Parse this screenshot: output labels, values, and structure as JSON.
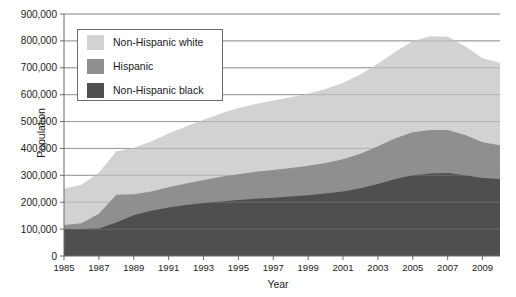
{
  "clipped_header": "",
  "axes": {
    "y_title": "Population",
    "x_title": "Year",
    "y_ticks": [
      "0",
      "100,000",
      "200,000",
      "300,000",
      "400,000",
      "500,000",
      "600,000",
      "700,000",
      "800,000",
      "900,000"
    ],
    "x_ticks": [
      "1985",
      "1987",
      "1989",
      "1991",
      "1993",
      "1995",
      "1997",
      "1999",
      "2001",
      "2003",
      "2005",
      "2007",
      "2009"
    ]
  },
  "legend": {
    "position": "inside-top-left",
    "items": [
      {
        "label": "Non-Hispanic white",
        "color": "#d2d2d2"
      },
      {
        "label": "Hispanic",
        "color": "#8f8f8f"
      },
      {
        "label": "Non-Hispanic black",
        "color": "#4f4f4f"
      }
    ]
  },
  "colors": {
    "non_hispanic_white": "#d2d2d2",
    "hispanic": "#8f8f8f",
    "non_hispanic_black": "#4f4f4f",
    "gridline": "#8c8c8c",
    "axis": "#6b6b6b",
    "background": "#ffffff"
  },
  "chart_data": {
    "type": "area",
    "stacked": true,
    "title": "",
    "xlabel": "Year",
    "ylabel": "Population",
    "xlim": [
      1985,
      2010
    ],
    "ylim": [
      0,
      900000
    ],
    "ytick_interval": 100000,
    "grid": true,
    "legend_position": "inside-top-left",
    "x": [
      1985,
      1986,
      1987,
      1988,
      1989,
      1990,
      1991,
      1992,
      1993,
      1994,
      1995,
      1996,
      1997,
      1998,
      1999,
      2000,
      2001,
      2002,
      2003,
      2004,
      2005,
      2006,
      2007,
      2008,
      2009,
      2010
    ],
    "categories": [
      "1985",
      "1986",
      "1987",
      "1988",
      "1989",
      "1990",
      "1991",
      "1992",
      "1993",
      "1994",
      "1995",
      "1996",
      "1997",
      "1998",
      "1999",
      "2000",
      "2001",
      "2002",
      "2003",
      "2004",
      "2005",
      "2006",
      "2007",
      "2008",
      "2009",
      "2010"
    ],
    "series": [
      {
        "name": "Non-Hispanic black",
        "color": "#4f4f4f",
        "values": [
          100000,
          100000,
          102000,
          125000,
          152000,
          168000,
          180000,
          190000,
          197000,
          203000,
          208000,
          213000,
          217000,
          221000,
          226000,
          232000,
          240000,
          252000,
          268000,
          286000,
          300000,
          307000,
          309000,
          300000,
          290000,
          286000
        ]
      },
      {
        "name": "Hispanic",
        "color": "#8f8f8f",
        "values": [
          15000,
          22000,
          55000,
          103000,
          78000,
          72000,
          76000,
          80000,
          86000,
          92000,
          96000,
          100000,
          103000,
          106000,
          110000,
          114000,
          120000,
          128000,
          140000,
          152000,
          160000,
          162000,
          160000,
          150000,
          133000,
          126000
        ]
      },
      {
        "name": "Non-Hispanic white",
        "color": "#d2d2d2",
        "values": [
          135000,
          143000,
          153000,
          162000,
          173000,
          186000,
          200000,
          212000,
          224000,
          235000,
          246000,
          252000,
          258000,
          263000,
          268000,
          275000,
          284000,
          295000,
          307000,
          322000,
          340000,
          348000,
          346000,
          330000,
          312000,
          307000
        ]
      }
    ],
    "stack_totals": [
      250000,
      265000,
      310000,
      390000,
      403000,
      426000,
      456000,
      482000,
      507000,
      530000,
      550000,
      565000,
      578000,
      590000,
      604000,
      621000,
      644000,
      675000,
      715000,
      760000,
      800000,
      817000,
      815000,
      780000,
      735000,
      719000
    ]
  }
}
